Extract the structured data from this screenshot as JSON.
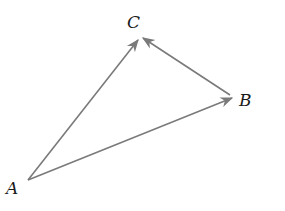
{
  "diagram": {
    "type": "vector-triangle",
    "points": {
      "A": {
        "label": "A",
        "x": 28,
        "y": 180
      },
      "B": {
        "label": "B",
        "x": 234,
        "y": 98
      },
      "C": {
        "label": "C",
        "x": 141,
        "y": 37
      }
    },
    "vectors": [
      {
        "from": "A",
        "to": "C"
      },
      {
        "from": "A",
        "to": "B"
      },
      {
        "from": "B",
        "to": "C"
      }
    ],
    "colors": {
      "line": "#7a7a7a",
      "label": "#1a1a1a"
    }
  }
}
